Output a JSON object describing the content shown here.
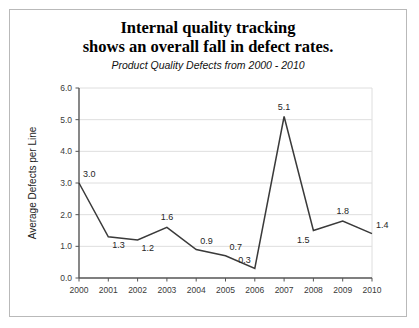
{
  "figure": {
    "title_line_1": "Internal quality tracking",
    "title_line_2": "shows an overall fall in defect rates.",
    "subtitle": "Product Quality Defects from 2000 - 2010",
    "border_color": "#b9b9b9",
    "background_color": "#ffffff"
  },
  "chart_data": {
    "type": "line",
    "title": "Internal quality tracking shows an overall fall in defect rates.",
    "subtitle": "Product Quality Defects from 2000 - 2010",
    "xlabel": "",
    "ylabel": "Average Defects per Line",
    "categories": [
      "2000",
      "2001",
      "2002",
      "2003",
      "2004",
      "2005",
      "2006",
      "2007",
      "2008",
      "2009",
      "2010"
    ],
    "values": [
      3.0,
      1.3,
      1.2,
      1.6,
      0.9,
      0.7,
      0.3,
      5.1,
      1.5,
      1.8,
      1.4
    ],
    "point_labels": [
      "3.0",
      "1.3",
      "1.2",
      "1.6",
      "0.9",
      "0.7",
      "0.3",
      "5.1",
      "1.5",
      "1.8",
      "1.4"
    ],
    "label_positions": [
      "above-right",
      "below-right",
      "below-right",
      "above",
      "above-right",
      "above-right",
      "above-left",
      "above",
      "below-left",
      "above",
      "above-right"
    ],
    "ylim": [
      0.0,
      6.0
    ],
    "yticks": [
      0.0,
      1.0,
      2.0,
      3.0,
      4.0,
      5.0,
      6.0
    ],
    "ytick_labels": [
      "0.0",
      "1.0",
      "2.0",
      "3.0",
      "4.0",
      "5.0",
      "6.0"
    ],
    "grid": true,
    "legend": false,
    "line_color": "#3a3a3a",
    "grid_color": "#dedede",
    "axis_color": "#555555"
  }
}
